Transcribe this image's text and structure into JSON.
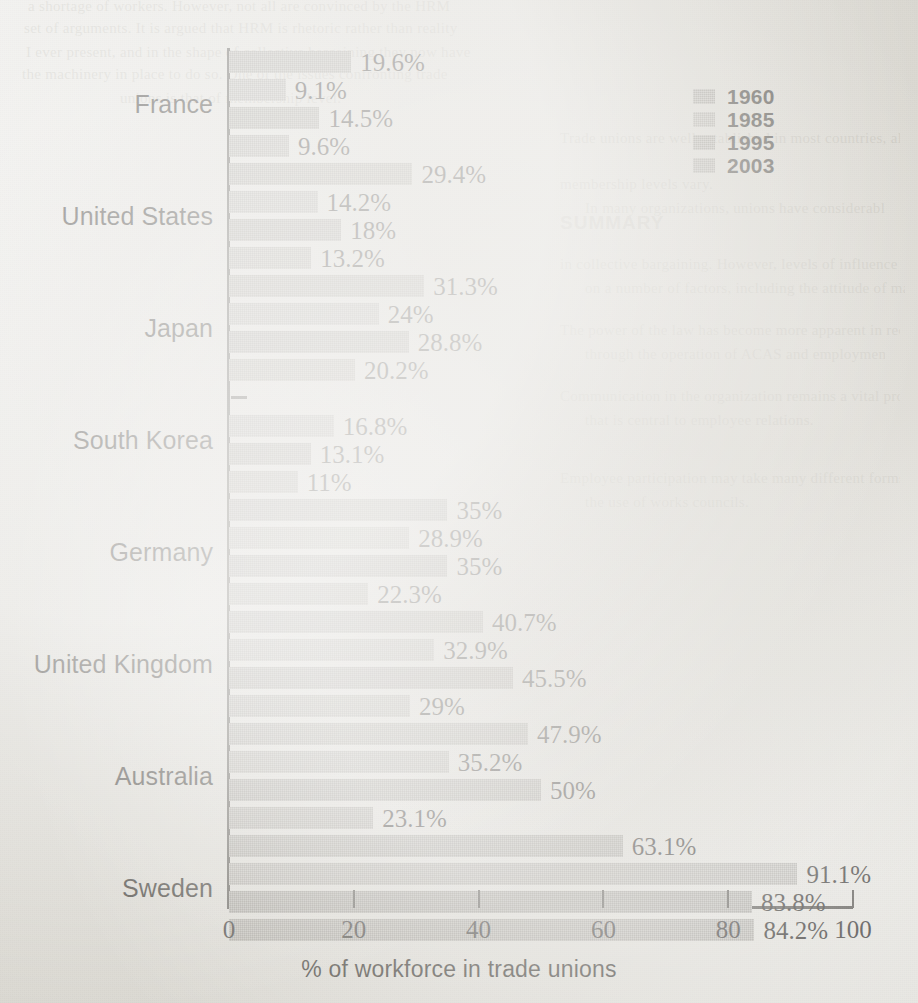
{
  "chart_data": {
    "type": "bar",
    "orientation": "horizontal",
    "title": "",
    "xlabel": "% of workforce in trade unions",
    "ylabel": "",
    "xlim": [
      0,
      100
    ],
    "xticks": [
      "0",
      "20",
      "40",
      "60",
      "80",
      "100"
    ],
    "grid": false,
    "legend_position": "top-right",
    "categories": [
      "France",
      "United States",
      "Japan",
      "South Korea",
      "Germany",
      "United Kingdom",
      "Australia",
      "Sweden"
    ],
    "series": [
      {
        "name": "1960",
        "color": "#a9a7a1",
        "values": [
          19.6,
          29.4,
          31.3,
          null,
          35,
          40.7,
          47.9,
          63.1
        ],
        "labels": [
          "19.6%",
          "29.4%",
          "31.3%",
          "",
          "35%",
          "40.7%",
          "47.9%",
          "63.1%"
        ]
      },
      {
        "name": "1985",
        "color": "#b3b1ab",
        "values": [
          9.1,
          14.2,
          24,
          16.8,
          28.9,
          32.9,
          35.2,
          91.1
        ],
        "labels": [
          "9.1%",
          "14.2%",
          "24%",
          "16.8%",
          "28.9%",
          "32.9%",
          "35.2%",
          "91.1%"
        ]
      },
      {
        "name": "1995",
        "color": "#a4a29c",
        "values": [
          14.5,
          18,
          28.8,
          13.1,
          35,
          45.5,
          50,
          83.8
        ],
        "labels": [
          "14.5%",
          "18%",
          "28.8%",
          "13.1%",
          "35%",
          "45.5%",
          "50%",
          "83.8%"
        ]
      },
      {
        "name": "2003",
        "color": "#adaba5",
        "values": [
          9.6,
          13.2,
          20.2,
          11,
          22.3,
          29,
          23.1,
          84.2
        ],
        "labels": [
          "9.6%",
          "13.2%",
          "20.2%",
          "11%",
          "22.3%",
          "29%",
          "23.1%",
          "84.2%"
        ]
      }
    ]
  },
  "legend": {
    "items": [
      {
        "label": "1960"
      },
      {
        "label": "1985"
      },
      {
        "label": "1995"
      },
      {
        "label": "2003"
      }
    ]
  },
  "axis": {
    "x_title": "% of workforce in trade unions",
    "x_tick_labels": [
      "0",
      "20",
      "40",
      "60",
      "80",
      "100"
    ]
  },
  "background_page_text": {
    "header": "SUMMARY",
    "lines": [
      "a shortage of workers. However, not all are convinced by the HRM",
      "set of arguments. It is argued that HRM is rhetoric rather than reality",
      "I ever present, and in the shape of collective bargaining they now have",
      "the machinery in place to do so. One of the issues confronting trade",
      "unions is that of membership level.",
      "Trade unions are well established in most countries, although",
      "membership levels vary.",
      "In many organizations, unions have considerable influence, especially",
      "in collective bargaining. However, levels of influence may be dependent",
      "on a number of factors, including the attitude of management.",
      "The power of the law has become more apparent in recent times",
      "through the operation of ACAS and employment tribunals.",
      "Communication in the organization remains a vital process and one",
      "that is central to employee relations.",
      "Employee participation may take many different forms, including",
      "the use of works councils."
    ]
  }
}
